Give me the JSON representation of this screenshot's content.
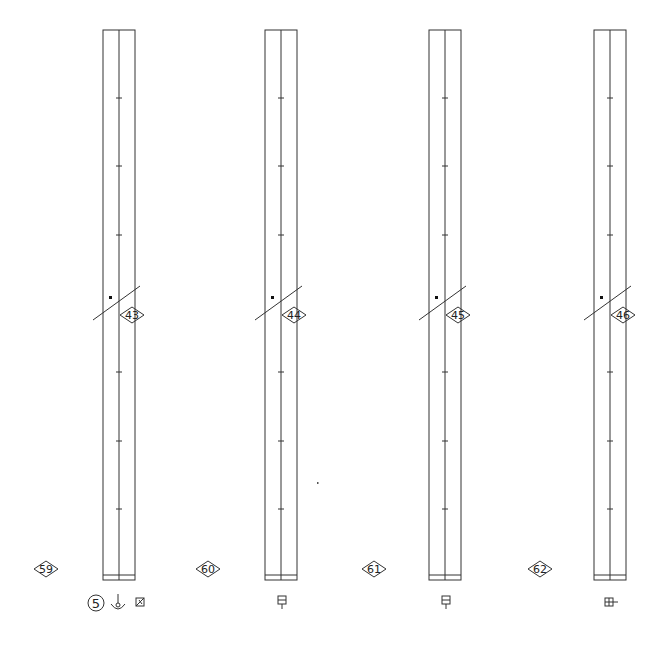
{
  "drawing": {
    "columns": [
      {
        "id": "col-1",
        "x": 103,
        "width": 32,
        "top": 30,
        "bottom": 580,
        "tag": "43",
        "grid_tag": "59"
      },
      {
        "id": "col-2",
        "x": 265,
        "width": 32,
        "top": 30,
        "bottom": 580,
        "tag": "44",
        "grid_tag": "60"
      },
      {
        "id": "col-3",
        "x": 429,
        "width": 32,
        "top": 30,
        "bottom": 580,
        "tag": "45",
        "grid_tag": "61"
      },
      {
        "id": "col-4",
        "x": 594,
        "width": 32,
        "top": 30,
        "bottom": 580,
        "tag": "46",
        "grid_tag": "62"
      }
    ],
    "tick_y": [
      98,
      166,
      235,
      372,
      441,
      509
    ],
    "cut_y": 302,
    "grid_tags": [
      "59",
      "60",
      "61",
      "62"
    ],
    "section_tags": [
      "43",
      "44",
      "45",
      "46"
    ],
    "callouts": {
      "circle_number": "5",
      "weld_symbol": "weld-symbol",
      "flag_symbol": "flag-symbol",
      "connection_symbols": [
        "box-tee",
        "box-tee",
        "box-tee-right"
      ]
    },
    "line_color": "#333333"
  }
}
